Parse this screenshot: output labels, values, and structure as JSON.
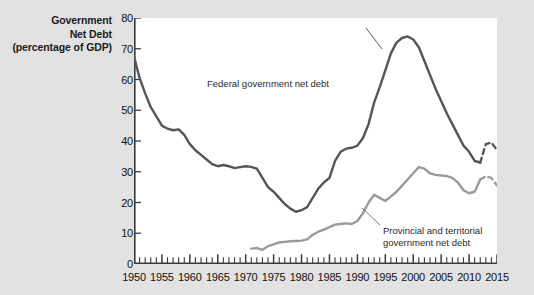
{
  "figure": {
    "title_lines": [
      "Government",
      "Net Debt",
      "(percentage of GDP)"
    ],
    "background_color": "#e2e2e2",
    "plot_background_color": "#ffffff"
  },
  "annotations": {
    "federal_label": "Federal government net debt",
    "provincial_label_line1": "Provincial and territorial",
    "provincial_label_line2": "government net debt"
  },
  "axes": {
    "y_ticks": [
      "0",
      "10",
      "20",
      "30",
      "40",
      "50",
      "60",
      "70",
      "80"
    ],
    "x_ticks": [
      "1950",
      "1955",
      "1960",
      "1965",
      "1970",
      "1975",
      "1980",
      "1985",
      "1990",
      "1995",
      "2000",
      "2005",
      "2010",
      "2015"
    ]
  },
  "chart_data": {
    "type": "line",
    "title": "Government Net Debt (percentage of GDP)",
    "xlabel": "",
    "ylabel": "Government Net Debt (percentage of GDP)",
    "xlim": [
      1950,
      2015
    ],
    "ylim": [
      0,
      80
    ],
    "y_tick_step": 10,
    "x_tick_step": 5,
    "x_minor_tick_step": 1,
    "grid": false,
    "legend": "inline-annotations",
    "series": [
      {
        "name": "Federal government net debt",
        "color": "#555555",
        "line_width": 2.4,
        "x": [
          1950,
          1951,
          1952,
          1953,
          1954,
          1955,
          1956,
          1957,
          1958,
          1959,
          1960,
          1961,
          1962,
          1963,
          1964,
          1965,
          1966,
          1967,
          1968,
          1969,
          1970,
          1971,
          1972,
          1973,
          1974,
          1975,
          1976,
          1977,
          1978,
          1979,
          1980,
          1981,
          1982,
          1983,
          1984,
          1985,
          1986,
          1987,
          1988,
          1989,
          1990,
          1991,
          1992,
          1993,
          1994,
          1995,
          1996,
          1997,
          1998,
          1999,
          2000,
          2001,
          2002,
          2003,
          2004,
          2005,
          2006,
          2007,
          2008,
          2009,
          2010,
          2011,
          2012,
          2013,
          2014,
          2015
        ],
        "y": [
          67.5,
          60.5,
          55.5,
          51.0,
          48.0,
          45.0,
          44.0,
          43.5,
          43.8,
          42.0,
          39.0,
          37.0,
          35.5,
          34.0,
          32.5,
          31.8,
          32.2,
          31.8,
          31.2,
          31.5,
          31.8,
          31.6,
          31.0,
          28.0,
          25.0,
          23.5,
          21.5,
          19.5,
          18.0,
          17.0,
          17.5,
          18.5,
          21.5,
          24.5,
          26.5,
          28.0,
          33.5,
          36.5,
          37.5,
          37.8,
          38.5,
          41.0,
          45.5,
          52.5,
          57.5,
          63.0,
          68.5,
          72.0,
          73.5,
          74.0,
          73.0,
          70.5,
          66.0,
          61.5,
          57.0,
          53.0,
          49.0,
          45.5,
          42.0,
          38.5,
          36.5,
          33.5,
          33.0,
          39.0,
          39.5,
          37.0
        ],
        "dashed_from": 2012
      },
      {
        "name": "Provincial and territorial government net debt",
        "color": "#9a9a9a",
        "line_width": 2.4,
        "x": [
          1971,
          1972,
          1973,
          1974,
          1975,
          1976,
          1977,
          1978,
          1979,
          1980,
          1981,
          1982,
          1983,
          1984,
          1985,
          1986,
          1987,
          1988,
          1989,
          1990,
          1991,
          1992,
          1993,
          1994,
          1995,
          1996,
          1997,
          1998,
          1999,
          2000,
          2001,
          2002,
          2003,
          2004,
          2005,
          2006,
          2007,
          2008,
          2009,
          2010,
          2011,
          2012,
          2013,
          2014,
          2015
        ],
        "y": [
          5.0,
          5.2,
          4.6,
          5.8,
          6.4,
          7.0,
          7.2,
          7.4,
          7.5,
          7.6,
          8.0,
          9.5,
          10.5,
          11.2,
          12.0,
          12.8,
          13.0,
          13.2,
          13.0,
          14.0,
          16.5,
          20.0,
          22.5,
          21.5,
          20.5,
          22.0,
          23.5,
          25.5,
          27.5,
          29.5,
          31.5,
          31.0,
          29.5,
          29.0,
          28.8,
          28.6,
          28.0,
          26.5,
          24.0,
          23.0,
          23.5,
          27.5,
          28.5,
          28.0,
          25.5
        ],
        "dashed_from": 2012
      }
    ]
  }
}
